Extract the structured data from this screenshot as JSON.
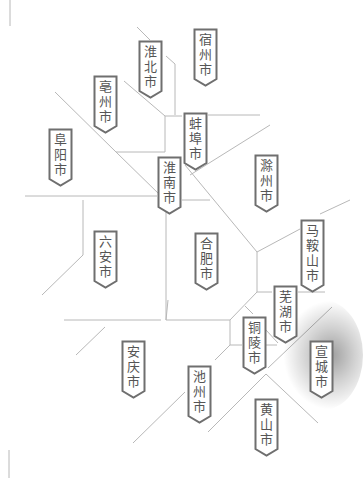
{
  "map": {
    "title": "",
    "line_color": "#b5b5b5",
    "tag_border_color": "#6f6f6f",
    "text_color": "#555555",
    "highlighted_city": "宣城市",
    "cities": [
      {
        "id": "suzhou",
        "name": "宿州市",
        "chars": [
          "宿",
          "州",
          "市"
        ],
        "x": 193,
        "y": 28
      },
      {
        "id": "huaibei",
        "name": "淮北市",
        "chars": [
          "淮",
          "北",
          "市"
        ],
        "x": 138,
        "y": 40
      },
      {
        "id": "bozhou",
        "name": "亳州市",
        "chars": [
          "亳",
          "州",
          "市"
        ],
        "x": 93,
        "y": 75
      },
      {
        "id": "fuyang",
        "name": "阜阳市",
        "chars": [
          "阜",
          "阳",
          "市"
        ],
        "x": 48,
        "y": 128
      },
      {
        "id": "bengbu",
        "name": "蚌埠市",
        "chars": [
          "蚌",
          "埠",
          "市"
        ],
        "x": 183,
        "y": 112
      },
      {
        "id": "huainan",
        "name": "淮南市",
        "chars": [
          "淮",
          "南",
          "市"
        ],
        "x": 157,
        "y": 156
      },
      {
        "id": "chuzhou",
        "name": "滁州市",
        "chars": [
          "滁",
          "州",
          "市"
        ],
        "x": 254,
        "y": 154
      },
      {
        "id": "luan",
        "name": "六安市",
        "chars": [
          "六",
          "安",
          "市"
        ],
        "x": 93,
        "y": 230
      },
      {
        "id": "hefei",
        "name": "合肥市",
        "chars": [
          "合",
          "肥",
          "市"
        ],
        "x": 194,
        "y": 232
      },
      {
        "id": "maanshan",
        "name": "马鞍山市",
        "chars": [
          "马",
          "鞍",
          "山",
          "市"
        ],
        "x": 300,
        "y": 219
      },
      {
        "id": "wuhu",
        "name": "芜湖市",
        "chars": [
          "芜",
          "湖",
          "市"
        ],
        "x": 273,
        "y": 285
      },
      {
        "id": "tongling",
        "name": "铜陵市",
        "chars": [
          "铜",
          "陵",
          "市"
        ],
        "x": 242,
        "y": 316
      },
      {
        "id": "xuancheng",
        "name": "宣城市",
        "chars": [
          "宣",
          "城",
          "市"
        ],
        "x": 309,
        "y": 340
      },
      {
        "id": "anqing",
        "name": "安庆市",
        "chars": [
          "安",
          "庆",
          "市"
        ],
        "x": 121,
        "y": 340
      },
      {
        "id": "chizhou",
        "name": "池州市",
        "chars": [
          "池",
          "州",
          "市"
        ],
        "x": 187,
        "y": 365
      },
      {
        "id": "huangshan",
        "name": "黄山市",
        "chars": [
          "黄",
          "山",
          "市"
        ],
        "x": 254,
        "y": 398
      }
    ]
  }
}
